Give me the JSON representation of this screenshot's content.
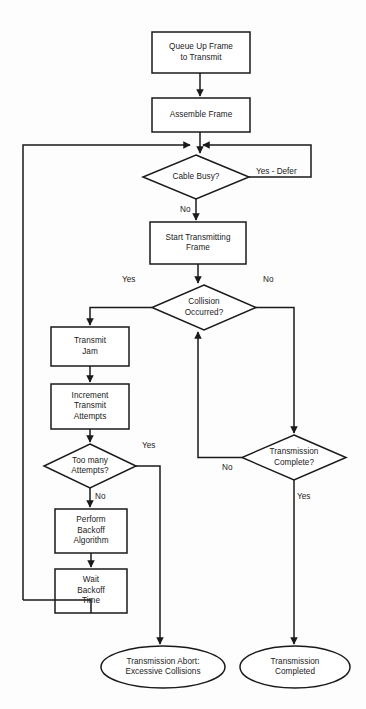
{
  "diagram": {
    "colors": {
      "background": "#fdfdfd",
      "stroke": "#1a1a1a",
      "text": "#1a1a1a",
      "fill": "#ffffff"
    },
    "nodes": [
      {
        "id": "queue-up-frame",
        "type": "process",
        "label": "Queue Up Frame\nto Transmit",
        "x": 152,
        "y": 32,
        "w": 98,
        "h": 41
      },
      {
        "id": "assemble-frame",
        "type": "process",
        "label": "Assemble Frame",
        "x": 152,
        "y": 98,
        "w": 98,
        "h": 34
      },
      {
        "id": "cable-busy",
        "type": "decision",
        "label": "Cable Busy?",
        "x": 143,
        "y": 155,
        "w": 106,
        "h": 44
      },
      {
        "id": "start-transmitting-frame",
        "type": "process",
        "label": "Start Transmitting\nFrame",
        "x": 150,
        "y": 222,
        "w": 96,
        "h": 42
      },
      {
        "id": "collision-occurred",
        "type": "decision",
        "label": "Collision\nOccurred?",
        "x": 152,
        "y": 285,
        "w": 104,
        "h": 45
      },
      {
        "id": "transmit-jam",
        "type": "process",
        "label": "Transmit\nJam",
        "x": 51,
        "y": 327,
        "w": 78,
        "h": 39
      },
      {
        "id": "increment-transmit-attempts",
        "type": "process",
        "label": "Increment\nTransmit\nAttempts",
        "x": 51,
        "y": 384,
        "w": 78,
        "h": 45
      },
      {
        "id": "too-many-attempts",
        "type": "decision",
        "label": "Too many\nAttempts?",
        "x": 44,
        "y": 444,
        "w": 92,
        "h": 44
      },
      {
        "id": "perform-backoff-algorithm",
        "type": "process",
        "label": "Perform\nBackoff\nAlgorithm",
        "x": 55,
        "y": 509,
        "w": 72,
        "h": 44
      },
      {
        "id": "wait-backoff-time",
        "type": "process",
        "label": "Wait\nBackoff\nTime",
        "x": 55,
        "y": 569,
        "w": 72,
        "h": 44
      },
      {
        "id": "transmission-complete",
        "type": "decision",
        "label": "Transmission\nComplete?",
        "x": 242,
        "y": 435,
        "w": 104,
        "h": 45
      },
      {
        "id": "transmission-abort",
        "type": "terminator",
        "label": "Transmission Abort:\nExcessive Collisions",
        "x": 101,
        "y": 646,
        "w": 124,
        "h": 42
      },
      {
        "id": "transmission-completed",
        "type": "terminator",
        "label": "Transmission\nCompleted",
        "x": 240,
        "y": 646,
        "w": 110,
        "h": 42
      }
    ],
    "edge_labels": [
      {
        "id": "cable-busy-yes-defer",
        "text": "Yes - Defer",
        "x": 256,
        "y": 167
      },
      {
        "id": "cable-busy-no",
        "text": "No",
        "x": 180,
        "y": 205
      },
      {
        "id": "collision-yes",
        "text": "Yes",
        "x": 122,
        "y": 275
      },
      {
        "id": "collision-no",
        "text": "No",
        "x": 263,
        "y": 275
      },
      {
        "id": "too-many-attempts-yes",
        "text": "Yes",
        "x": 142,
        "y": 441
      },
      {
        "id": "too-many-attempts-no",
        "text": "No",
        "x": 95,
        "y": 492
      },
      {
        "id": "transmission-complete-no",
        "text": "No",
        "x": 222,
        "y": 463
      },
      {
        "id": "transmission-complete-yes",
        "text": "Yes",
        "x": 297,
        "y": 492
      }
    ]
  }
}
